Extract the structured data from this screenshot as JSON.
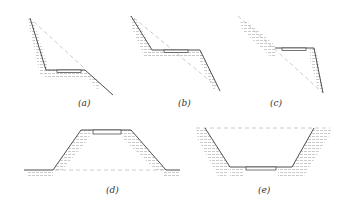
{
  "figure": {
    "panels": [
      {
        "id": "a",
        "label": "(a)",
        "type": "half-cut-half-fill on steep slope"
      },
      {
        "id": "b",
        "label": "(b)",
        "type": "half-cut-half-fill"
      },
      {
        "id": "c",
        "label": "(c)",
        "type": "cut with retaining"
      },
      {
        "id": "d",
        "label": "(d)",
        "type": "embankment (fill)"
      },
      {
        "id": "e",
        "label": "(e)",
        "type": "cutting (excavation)"
      }
    ]
  },
  "labels": {
    "a": "(a)",
    "b": "(b)",
    "c": "(c)",
    "d": "(d)",
    "e": "(e)"
  },
  "colors": {
    "line": "#3a3a3a",
    "dash": "#bdbdbd",
    "hatch": "#9a9a9a"
  }
}
